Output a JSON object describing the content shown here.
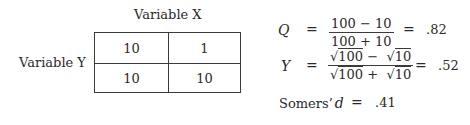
{
  "table": {
    "column_variable_label": "Variable X",
    "row_variable_label": "Variable Y",
    "cells": [
      [
        "10",
        "1"
      ],
      [
        "10",
        "10"
      ]
    ]
  },
  "formulas": {
    "q": {
      "symbol": "Q",
      "equals": "=",
      "numerator": "100 − 10",
      "denominator": "100 + 10",
      "result": ".82"
    },
    "y": {
      "symbol": "Y",
      "equals": "=",
      "sqrt_symbol": "√",
      "numerator_a": "100",
      "numerator_op": "−",
      "numerator_b": "10",
      "denominator_a": "100",
      "denominator_op": "+",
      "denominator_b": "10",
      "result": ".52"
    },
    "somers": {
      "label": "Somers’",
      "symbol": "d",
      "equals": "=",
      "result": ".41"
    }
  }
}
